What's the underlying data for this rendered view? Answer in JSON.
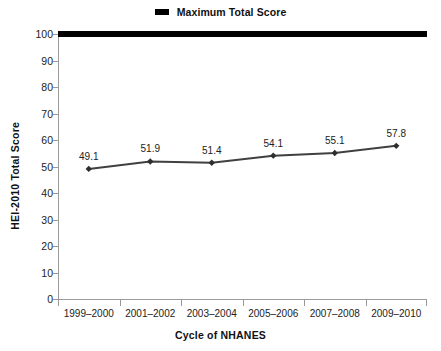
{
  "legend": {
    "marker_name": "legend-line-swatch",
    "label": "Maximum Total Score",
    "color": "#000000",
    "position": "top-center"
  },
  "axes": {
    "ylabel": "HEI-2010 Total Score",
    "xlabel": "Cycle of NHANES",
    "ytick_labels": [
      "0",
      "10",
      "20",
      "30",
      "40",
      "50",
      "60",
      "70",
      "80",
      "90",
      "100"
    ]
  },
  "chart_data": {
    "type": "line",
    "title": "",
    "subtitle": "",
    "xlabel": "Cycle of NHANES",
    "ylabel": "HEI-2010 Total Score",
    "categories": [
      "1999–2000",
      "2001–2002",
      "2003–2004",
      "2005–2006",
      "2007–2008",
      "2009–2010"
    ],
    "values": [
      49.1,
      51.9,
      51.4,
      54.1,
      55.1,
      57.8
    ],
    "point_labels": [
      "49.1",
      "51.9",
      "51.4",
      "54.1",
      "55.1",
      "57.8"
    ],
    "series": [
      {
        "name": "HEI-2010 Total Score",
        "values": [
          49.1,
          51.9,
          51.4,
          54.1,
          55.1,
          57.8
        ],
        "color": "#404040",
        "marker": "diamond"
      },
      {
        "name": "Maximum Total Score",
        "type": "reference-line",
        "value": 100,
        "color": "#000000"
      }
    ],
    "ylim": [
      0,
      100
    ],
    "yticks": [
      0,
      10,
      20,
      30,
      40,
      50,
      60,
      70,
      80,
      90,
      100
    ],
    "grid": false,
    "legend_position": "top-center"
  }
}
